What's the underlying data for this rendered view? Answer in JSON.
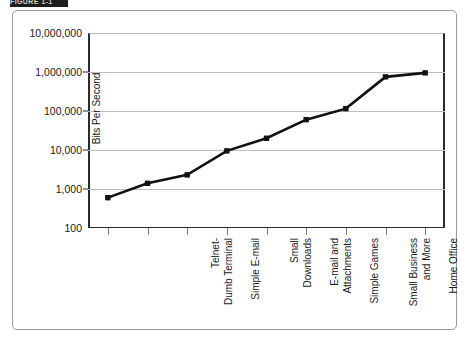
{
  "caption": {
    "strip_text": "FIGURE 1-1"
  },
  "chart_data": {
    "type": "line",
    "title": "",
    "xlabel": "",
    "ylabel": "Bits Per Second",
    "yscale": "log",
    "ylim": [
      100,
      10000000
    ],
    "ytick_labels": [
      "10,000,000",
      "1,000,000",
      "100,000",
      "10,000",
      "1,000",
      "100"
    ],
    "ytick_values": [
      10000000,
      1000000,
      100000,
      10000,
      1000,
      100
    ],
    "grid": true,
    "legend": "none",
    "categories": [
      "Telnet-\nDumb Terminal",
      "Simple E-mail",
      "Small\nDownloads",
      "E-mail and\nAttachments",
      "Simple Games",
      "Small Business\nand More",
      "Home Office",
      "Home Office",
      "Home Office"
    ],
    "values": [
      600,
      1400,
      2300,
      9500,
      20000,
      60000,
      115000,
      750000,
      950000
    ],
    "series": [
      {
        "name": "Bits Per Second",
        "values": [
          600,
          1400,
          2300,
          9500,
          20000,
          60000,
          115000,
          750000,
          950000
        ]
      }
    ],
    "marker": "square",
    "line_color": "#111111",
    "marker_color": "#111111"
  }
}
